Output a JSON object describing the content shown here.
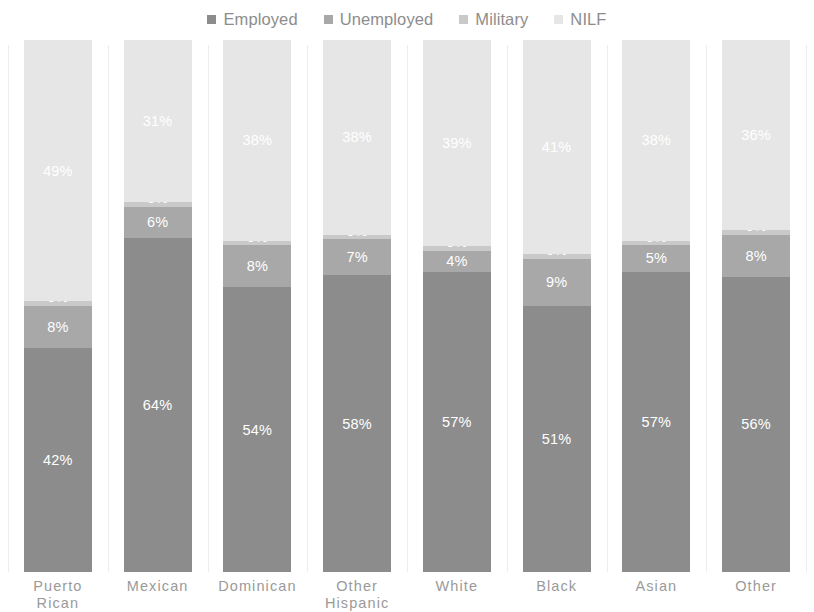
{
  "legend": {
    "position": "top",
    "items": [
      {
        "label": "Employed",
        "color": "#8c8c8c"
      },
      {
        "label": "Unemployed",
        "color": "#a8a8a8"
      },
      {
        "label": "Military",
        "color": "#c9c9c9"
      },
      {
        "label": "NILF",
        "color": "#e6e6e6"
      }
    ]
  },
  "axis": {
    "categories": [
      {
        "line1": "Puerto",
        "line2": "Rican"
      },
      {
        "line1": "Mexican",
        "line2": ""
      },
      {
        "line1": "Dominican",
        "line2": ""
      },
      {
        "line1": "Other",
        "line2": "Hispanic"
      },
      {
        "line1": "White",
        "line2": ""
      },
      {
        "line1": "Black",
        "line2": ""
      },
      {
        "line1": "Asian",
        "line2": ""
      },
      {
        "line1": "Other",
        "line2": ""
      }
    ]
  },
  "chart_data": {
    "type": "bar",
    "stacked": true,
    "normalized": true,
    "title": "",
    "subtitle": "",
    "xlabel": "",
    "ylabel": "",
    "ylim": [
      0,
      100
    ],
    "grid": "vertical-only",
    "legend_position": "top",
    "value_suffix": "%",
    "categories": [
      "Puerto Rican",
      "Mexican",
      "Dominican",
      "Other Hispanic",
      "White",
      "Black",
      "Asian",
      "Other"
    ],
    "series": [
      {
        "name": "Employed",
        "color": "#8c8c8c",
        "values": [
          42,
          64,
          54,
          58,
          57,
          51,
          57,
          56
        ],
        "labels": [
          "42%",
          "64%",
          "54%",
          "58%",
          "57%",
          "51%",
          "57%",
          "56%"
        ]
      },
      {
        "name": "Unemployed",
        "color": "#a8a8a8",
        "values": [
          8,
          6,
          8,
          7,
          4,
          9,
          5,
          8
        ],
        "labels": [
          "8%",
          "6%",
          "8%",
          "7%",
          "4%",
          "9%",
          "5%",
          "8%"
        ]
      },
      {
        "name": "Military",
        "color": "#c9c9c9",
        "values": [
          0,
          0,
          0,
          0,
          0,
          0,
          0,
          0
        ],
        "labels": [
          "0%",
          "0%",
          "0%",
          "0%",
          "0%",
          "0%",
          "0%",
          "0%"
        ]
      },
      {
        "name": "NILF",
        "color": "#e6e6e6",
        "values": [
          49,
          31,
          38,
          38,
          39,
          41,
          38,
          36
        ],
        "labels": [
          "49%",
          "31%",
          "38%",
          "38%",
          "39%",
          "41%",
          "38%",
          "36%"
        ]
      }
    ]
  }
}
